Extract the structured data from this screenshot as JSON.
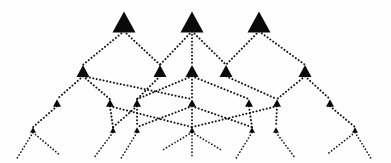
{
  "figure": {
    "title": "",
    "background_color": "#fefefe",
    "node_color": "#0a0a0a",
    "edge_color": "#141414",
    "node_glyph": "triangle-up",
    "edge_style": "dotted",
    "width": 391,
    "height": 163,
    "level_count": 4
  },
  "chart_data": {
    "type": "diagram",
    "diagram_kind": "hierarchical-triangle-tree",
    "title": "",
    "xlabel": "",
    "ylabel": "",
    "levels": [
      {
        "index": 0,
        "label": "level-1",
        "node_size": 23,
        "y": 22,
        "node_count": 3,
        "nodes": [
          {
            "id": "L0N0",
            "x": 124,
            "y": 22,
            "size": 23
          },
          {
            "id": "L0N1",
            "x": 192,
            "y": 22,
            "size": 23
          },
          {
            "id": "L0N2",
            "x": 259,
            "y": 22,
            "size": 23
          }
        ]
      },
      {
        "index": 1,
        "label": "level-2",
        "node_size": 13,
        "y": 71,
        "node_count": 5,
        "nodes": [
          {
            "id": "L1N0",
            "x": 83,
            "y": 71,
            "size": 13
          },
          {
            "id": "L1N1",
            "x": 160,
            "y": 71,
            "size": 13
          },
          {
            "id": "L1N2",
            "x": 192,
            "y": 71,
            "size": 13
          },
          {
            "id": "L1N3",
            "x": 226,
            "y": 71,
            "size": 13
          },
          {
            "id": "L1N4",
            "x": 305,
            "y": 71,
            "size": 13
          }
        ]
      },
      {
        "index": 2,
        "label": "level-3",
        "node_size": 8,
        "y": 103,
        "node_count": 7,
        "nodes": [
          {
            "id": "L2N0",
            "x": 57,
            "y": 103,
            "size": 8
          },
          {
            "id": "L2N1",
            "x": 110,
            "y": 103,
            "size": 8
          },
          {
            "id": "L2N2",
            "x": 137,
            "y": 103,
            "size": 8
          },
          {
            "id": "L2N3",
            "x": 192,
            "y": 103,
            "size": 8
          },
          {
            "id": "L2N4",
            "x": 249,
            "y": 103,
            "size": 8
          },
          {
            "id": "L2N5",
            "x": 277,
            "y": 103,
            "size": 8
          },
          {
            "id": "L2N6",
            "x": 330,
            "y": 103,
            "size": 8
          }
        ]
      },
      {
        "index": 3,
        "label": "level-4",
        "node_size": 6,
        "y": 130,
        "node_count": 7,
        "nodes": [
          {
            "id": "L3N0",
            "x": 33,
            "y": 130,
            "size": 6
          },
          {
            "id": "L3N1",
            "x": 113,
            "y": 130,
            "size": 6
          },
          {
            "id": "L3N2",
            "x": 137,
            "y": 130,
            "size": 6
          },
          {
            "id": "L3N3",
            "x": 192,
            "y": 130,
            "size": 6
          },
          {
            "id": "L3N4",
            "x": 252,
            "y": 130,
            "size": 6
          },
          {
            "id": "L3N5",
            "x": 276,
            "y": 130,
            "size": 6
          },
          {
            "id": "L3N6",
            "x": 355,
            "y": 130,
            "size": 6
          }
        ]
      }
    ],
    "edges": [
      {
        "from": "L0N0",
        "to": "L1N0"
      },
      {
        "from": "L0N0",
        "to": "L1N1"
      },
      {
        "from": "L0N1",
        "to": "L1N1"
      },
      {
        "from": "L0N1",
        "to": "L1N2"
      },
      {
        "from": "L0N1",
        "to": "L1N3"
      },
      {
        "from": "L0N2",
        "to": "L1N3"
      },
      {
        "from": "L0N2",
        "to": "L1N4"
      },
      {
        "from": "L1N0",
        "to": "L2N0"
      },
      {
        "from": "L1N0",
        "to": "L2N1"
      },
      {
        "from": "L1N0",
        "to": "L2N3"
      },
      {
        "from": "L1N1",
        "to": "L2N2"
      },
      {
        "from": "L1N2",
        "to": "L2N2"
      },
      {
        "from": "L1N2",
        "to": "L2N3"
      },
      {
        "from": "L1N2",
        "to": "L2N4"
      },
      {
        "from": "L1N3",
        "to": "L2N5"
      },
      {
        "from": "L1N4",
        "to": "L2N5"
      },
      {
        "from": "L1N4",
        "to": "L2N6"
      },
      {
        "from": "L2N0",
        "to": "L3N0"
      },
      {
        "from": "L2N1",
        "to": "L3N1"
      },
      {
        "from": "L2N1",
        "to": "L3N3"
      },
      {
        "from": "L2N2",
        "to": "L3N1"
      },
      {
        "from": "L2N2",
        "to": "L3N2"
      },
      {
        "from": "L2N3",
        "to": "L3N2"
      },
      {
        "from": "L2N3",
        "to": "L3N3"
      },
      {
        "from": "L2N3",
        "to": "L3N4"
      },
      {
        "from": "L2N4",
        "to": "L3N4"
      },
      {
        "from": "L2N5",
        "to": "L3N5"
      },
      {
        "from": "L2N5",
        "to": "L3N3"
      },
      {
        "from": "L2N6",
        "to": "L3N6"
      }
    ],
    "leaf_stubs": [
      {
        "from": "L3N0",
        "dx": -16,
        "dy": 26
      },
      {
        "from": "L3N0",
        "dx": 26,
        "dy": 22
      },
      {
        "from": "L3N1",
        "dx": -18,
        "dy": 24
      },
      {
        "from": "L3N2",
        "dx": -16,
        "dy": 26
      },
      {
        "from": "L3N3",
        "dx": -30,
        "dy": 18
      },
      {
        "from": "L3N3",
        "dx": 0,
        "dy": 26
      },
      {
        "from": "L3N3",
        "dx": 30,
        "dy": 18
      },
      {
        "from": "L3N4",
        "dx": -16,
        "dy": 26
      },
      {
        "from": "L3N5",
        "dx": 18,
        "dy": 24
      },
      {
        "from": "L3N6",
        "dx": -28,
        "dy": 22
      },
      {
        "from": "L3N6",
        "dx": 16,
        "dy": 26
      }
    ]
  }
}
